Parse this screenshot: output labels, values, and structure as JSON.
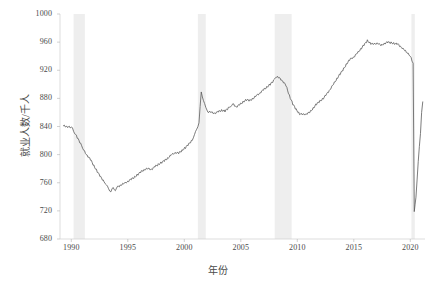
{
  "chart_data": {
    "type": "line",
    "title": "",
    "xlabel": "年份",
    "ylabel": "就业人数/千人",
    "xlim": [
      1989.0,
      2021.3
    ],
    "ylim": [
      680,
      1000
    ],
    "xticks": [
      1990,
      1995,
      2000,
      2005,
      2010,
      2015,
      2020
    ],
    "xtick_labels": [
      "1990",
      "1995",
      "2000",
      "2005",
      "2010",
      "2015",
      "2020"
    ],
    "yticks": [
      680,
      720,
      760,
      800,
      840,
      880,
      920,
      960,
      1000
    ],
    "ytick_labels": [
      "680",
      "720",
      "760",
      "800",
      "840",
      "880",
      "920",
      "960",
      "1000"
    ],
    "grid": false,
    "legend": "none",
    "line_color": "#5a5a5a",
    "band_color": "#ebebeb",
    "shaded_regions": [
      {
        "name": "recession-1990",
        "x0": 1990.2,
        "x1": 1991.2
      },
      {
        "name": "recession-2001",
        "x0": 2001.2,
        "x1": 2001.9
      },
      {
        "name": "recession-2008",
        "x0": 2008.0,
        "x1": 2009.5
      },
      {
        "name": "recession-2020",
        "x0": 2020.1,
        "x1": 2020.4
      }
    ],
    "series": [
      {
        "name": "就业人数",
        "x": [
          1989.3,
          1989.6,
          1989.9,
          1990.1,
          1990.3,
          1990.6,
          1990.9,
          1991.1,
          1991.4,
          1991.7,
          1992.0,
          1992.3,
          1992.6,
          1992.9,
          1993.1,
          1993.3,
          1993.5,
          1993.7,
          1993.9,
          1994.1,
          1994.4,
          1994.7,
          1995.0,
          1995.3,
          1995.6,
          1995.9,
          1996.2,
          1996.5,
          1996.8,
          1997.1,
          1997.4,
          1997.7,
          1998.0,
          1998.3,
          1998.6,
          1998.9,
          1999.2,
          1999.5,
          1999.8,
          2000.1,
          2000.4,
          2000.7,
          2000.9,
          2001.1,
          2001.3,
          2001.5,
          2001.7,
          2001.9,
          2002.1,
          2002.4,
          2002.7,
          2003.0,
          2003.3,
          2003.6,
          2003.9,
          2004.1,
          2004.3,
          2004.6,
          2004.9,
          2005.2,
          2005.5,
          2005.8,
          2006.1,
          2006.4,
          2006.7,
          2007.0,
          2007.3,
          2007.6,
          2007.9,
          2008.1,
          2008.4,
          2008.7,
          2009.0,
          2009.3,
          2009.6,
          2009.9,
          2010.2,
          2010.5,
          2010.8,
          2011.1,
          2011.4,
          2011.7,
          2012.0,
          2012.3,
          2012.6,
          2012.9,
          2013.2,
          2013.5,
          2013.8,
          2014.1,
          2014.4,
          2014.7,
          2015.0,
          2015.3,
          2015.6,
          2015.9,
          2016.2,
          2016.5,
          2016.8,
          2017.1,
          2017.4,
          2017.7,
          2018.0,
          2018.3,
          2018.6,
          2018.9,
          2019.2,
          2019.5,
          2019.8,
          2020.0,
          2020.15,
          2020.25,
          2020.35,
          2020.5,
          2020.7,
          2020.9,
          2021.0,
          2021.1
        ],
        "y": [
          841,
          840,
          839,
          837,
          831,
          822,
          814,
          806,
          799,
          793,
          784,
          776,
          768,
          762,
          757,
          751,
          748,
          752,
          750,
          754,
          757,
          759,
          762,
          765,
          768,
          772,
          776,
          779,
          780,
          779,
          783,
          786,
          789,
          792,
          796,
          800,
          803,
          802,
          806,
          810,
          815,
          821,
          828,
          836,
          846,
          888,
          878,
          866,
          861,
          860,
          859,
          861,
          863,
          862,
          866,
          869,
          872,
          868,
          871,
          875,
          878,
          877,
          880,
          884,
          888,
          892,
          896,
          900,
          905,
          911,
          909,
          905,
          898,
          884,
          872,
          864,
          858,
          857,
          858,
          860,
          866,
          872,
          876,
          880,
          886,
          893,
          900,
          908,
          915,
          922,
          930,
          936,
          939,
          944,
          950,
          956,
          962,
          958,
          957,
          959,
          955,
          958,
          960,
          959,
          958,
          957,
          953,
          948,
          944,
          941,
          933,
          930,
          718,
          740,
          790,
          830,
          860,
          875
        ]
      }
    ]
  },
  "axes": {
    "y_label_text": "就业人数/千人",
    "x_label_text": "年份"
  }
}
